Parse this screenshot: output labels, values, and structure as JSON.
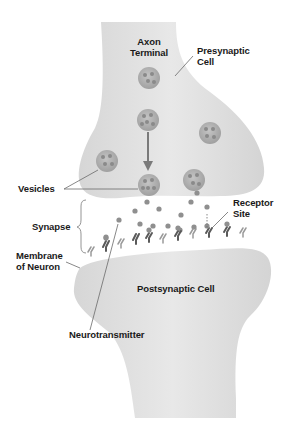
{
  "diagram": {
    "type": "synapse-illustration",
    "labels": {
      "axon_terminal_line1": "Axon",
      "axon_terminal_line2": "Terminal",
      "presynaptic_line1": "Presynaptic",
      "presynaptic_line2": "Cell",
      "vesicles": "Vesicles",
      "receptor_line1": "Receptor",
      "receptor_line2": "Site",
      "synapse": "Synapse",
      "membrane_line1": "Membrane",
      "membrane_line2": "of Neuron",
      "postsynaptic": "Postsynaptic Cell",
      "neurotransmitter": "Neurotransmitter"
    },
    "colors": {
      "cell_fill": "#e2e2e2",
      "cell_shadow": "#cfcfcf",
      "vesicle_fill": "#a9a9a9",
      "particle_fill": "#8f8f8f",
      "receptor_dark": "#5a5a5a",
      "receptor_light": "#9a9a9a",
      "label_text": "#1a1a1a",
      "leader_line": "#6a6a6a"
    }
  }
}
